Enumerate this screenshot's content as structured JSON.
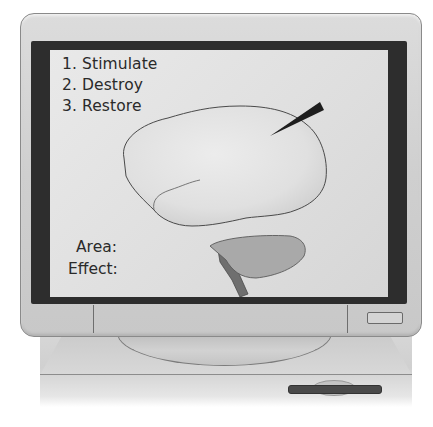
{
  "illustration": {
    "subject": "computer monitor displaying brain diagram",
    "colors": {
      "bezel": "#d2d2d2",
      "screen_frame": "#2d2d2d",
      "screen_background": "#e2e2e2",
      "brain_cerebrum": "#e4e4e4",
      "brain_cerebellum": "#a9a9a9",
      "brain_stem": "#6f6f6f",
      "probe": "#1e1e1e",
      "text": "#2a2a2a"
    }
  },
  "screen": {
    "menu": [
      {
        "number": "1.",
        "label": "Stimulate",
        "text": "1. Stimulate"
      },
      {
        "number": "2.",
        "label": "Destroy",
        "text": "2. Destroy"
      },
      {
        "number": "3.",
        "label": "Restore",
        "text": "3. Restore"
      }
    ],
    "fields": {
      "area_label": "Area:",
      "effect_label": "Effect:"
    },
    "diagram": {
      "icons": [
        "brain-icon",
        "probe-icon"
      ]
    }
  },
  "hardware": {
    "icons": [
      "power-button-icon",
      "floppy-drive-icon"
    ]
  }
}
